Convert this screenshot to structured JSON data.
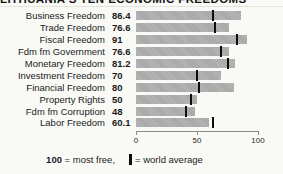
{
  "title": "LITHUANIA'S TEN ECONOMIC FREEDOMS",
  "chart_data": {
    "type": "bar",
    "orientation": "horizontal",
    "categories": [
      "Business Freedom",
      "Trade Freedom",
      "Fiscal Freedom",
      "Fdm fm Government",
      "Monetary Freedom",
      "Investment Freedom",
      "Financial Freedom",
      "Property Rights",
      "Fdm fm Corruption",
      "Labor Freedom"
    ],
    "values": [
      86.4,
      76.6,
      91,
      76.6,
      81.2,
      70,
      80,
      50,
      48,
      60.1
    ],
    "value_labels": [
      "86.4",
      "76.6",
      "91",
      "76.6",
      "81.2",
      "70",
      "80",
      "50",
      "48",
      "60.1"
    ],
    "world_averages": [
      63,
      65,
      83,
      70,
      75,
      50,
      52,
      45,
      41,
      63
    ],
    "xlim": [
      0,
      100
    ],
    "x_ticks": [
      0,
      50,
      100
    ],
    "x_tick_labels": [
      "0",
      "50",
      "100"
    ],
    "grid": false,
    "bar_color": "#aeaeae",
    "marker_color": "#0d0d0d",
    "legend_position": "bottom"
  },
  "legend": {
    "scale_value": "100",
    "scale_text": " = most free,",
    "marker_glyph": "world-average-tick",
    "marker_text": "= world average"
  }
}
